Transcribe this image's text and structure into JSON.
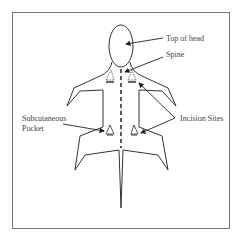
{
  "diagram": {
    "title": "",
    "labels": {
      "top_of_head": "Top of head",
      "spine": "Spine",
      "subcutaneous_line1": "Subcutaneous",
      "subcutaneous_line2": "Pocket",
      "incision_sites": "Incision Sites"
    },
    "colors": {
      "line": "#333333",
      "frame": "#777777",
      "background": "#ffffff"
    }
  }
}
